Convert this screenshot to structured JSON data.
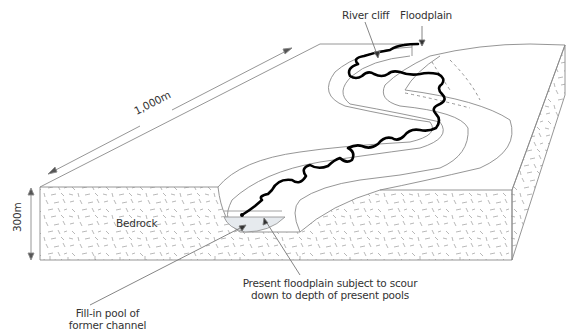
{
  "diagram": {
    "type": "block-diagram",
    "labels": {
      "river_cliff": "River cliff",
      "floodplain": "Floodplain",
      "length": "1,000m",
      "depth": "300m",
      "bedrock": "Bedrock",
      "present_floodplain_line1": "Present floodplain subject to scour",
      "present_floodplain_line2": "down to depth of present pools",
      "fill_in_pool_line1": "Fill-in pool of",
      "fill_in_pool_line2": "former channel"
    },
    "colors": {
      "outline": "#8a8a8a",
      "river": "#000000",
      "hatch": "#9a9a9a",
      "pool_fill": "#e6eaee",
      "text": "#333333"
    }
  }
}
